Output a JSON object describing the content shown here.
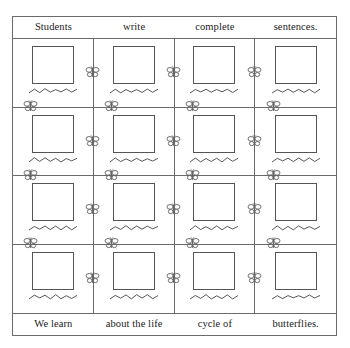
{
  "worksheet": {
    "top_cropped_text": "",
    "header_sentence": {
      "words": [
        "Students",
        "write",
        "complete",
        "sentences."
      ]
    },
    "footer_sentence": {
      "words": [
        "We learn",
        "about the life",
        "cycle of",
        "butterflies."
      ]
    },
    "grid": {
      "columns": 4,
      "rows": 4,
      "cell_content": {
        "drawing_box_label": "",
        "writing_line_label": ""
      }
    },
    "icons": {
      "butterfly": "butterfly-icon",
      "drawing_box": "drawing-box",
      "writing_squiggle": "writing-squiggle"
    },
    "colors": {
      "frame": "#6a6a6a",
      "box_outline": "#555555",
      "squiggle": "#444444",
      "butterfly": "#666666",
      "text": "#222222",
      "page": "#ffffff"
    }
  }
}
